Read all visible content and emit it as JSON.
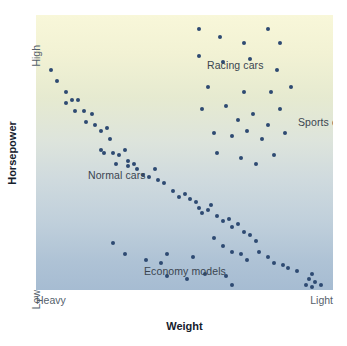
{
  "chart_data": {
    "type": "scatter",
    "title": "",
    "xlabel": "Weight",
    "ylabel": "Horsepower",
    "xlim": [
      "Heavy",
      "Light"
    ],
    "ylim": [
      "Low",
      "High"
    ],
    "x_tick_labels": [
      "Heavy",
      "Light"
    ],
    "y_tick_labels": [
      "High",
      "Low"
    ],
    "grid": false,
    "legend": "none",
    "axis_note": "Qualitative axes: x runs Heavy (left) to Light (right); y runs Low (bottom) to High (top). Values below are normalized 0-100 where x=0 is Heavy, x=100 is Light, y=0 is Low, y=100 is High.",
    "marker_color": "#2e4a72",
    "background_gradient": [
      "#f8f7d9",
      "#dde4dc",
      "#a6bcd2"
    ],
    "annotations": [
      {
        "text": "Racing cars",
        "x": 46,
        "y": 89
      },
      {
        "text": "Sports cars",
        "x": 77,
        "y": 68
      },
      {
        "text": "Normal cars",
        "x": 7,
        "y": 49
      },
      {
        "text": "Economy models",
        "x": 25,
        "y": 14
      }
    ],
    "series": [
      {
        "name": "all cars",
        "points": [
          [
            5,
            80
          ],
          [
            7,
            76
          ],
          [
            10,
            72
          ],
          [
            10,
            68
          ],
          [
            12,
            69
          ],
          [
            14,
            69
          ],
          [
            13,
            65
          ],
          [
            16,
            65
          ],
          [
            19,
            64
          ],
          [
            17,
            61
          ],
          [
            20,
            60
          ],
          [
            22,
            58
          ],
          [
            24,
            59
          ],
          [
            25,
            55
          ],
          [
            22,
            51
          ],
          [
            23,
            50
          ],
          [
            26,
            50
          ],
          [
            28,
            49
          ],
          [
            30,
            51
          ],
          [
            31,
            47
          ],
          [
            33,
            46
          ],
          [
            27,
            46
          ],
          [
            31,
            45
          ],
          [
            34,
            44
          ],
          [
            36,
            42
          ],
          [
            38,
            41
          ],
          [
            40,
            44
          ],
          [
            41,
            40
          ],
          [
            43,
            39
          ],
          [
            46,
            36
          ],
          [
            48,
            34
          ],
          [
            50,
            35
          ],
          [
            52,
            33
          ],
          [
            54,
            32
          ],
          [
            55,
            30
          ],
          [
            56,
            28
          ],
          [
            58,
            29
          ],
          [
            59,
            31
          ],
          [
            61,
            27
          ],
          [
            63,
            25
          ],
          [
            65,
            26
          ],
          [
            66,
            23
          ],
          [
            68,
            24
          ],
          [
            70,
            21
          ],
          [
            72,
            20
          ],
          [
            74,
            18
          ],
          [
            60,
            19
          ],
          [
            63,
            16
          ],
          [
            66,
            14
          ],
          [
            69,
            13
          ],
          [
            71,
            11
          ],
          [
            75,
            14
          ],
          [
            78,
            12
          ],
          [
            80,
            10
          ],
          [
            83,
            9
          ],
          [
            85,
            8
          ],
          [
            88,
            7
          ],
          [
            93,
            6
          ],
          [
            92,
            4
          ],
          [
            94,
            3
          ],
          [
            96,
            2
          ],
          [
            91,
            2
          ],
          [
            93,
            1
          ],
          [
            26,
            17
          ],
          [
            30,
            13
          ],
          [
            37,
            11
          ],
          [
            42,
            10
          ],
          [
            44,
            13
          ],
          [
            53,
            12
          ],
          [
            44,
            5
          ],
          [
            51,
            4
          ],
          [
            57,
            6
          ],
          [
            64,
            5
          ],
          [
            66,
            2
          ],
          [
            55,
            95
          ],
          [
            62,
            92
          ],
          [
            70,
            90
          ],
          [
            78,
            95
          ],
          [
            82,
            90
          ],
          [
            55,
            85
          ],
          [
            63,
            83
          ],
          [
            72,
            84
          ],
          [
            81,
            80
          ],
          [
            58,
            74
          ],
          [
            70,
            72
          ],
          [
            79,
            72
          ],
          [
            86,
            74
          ],
          [
            56,
            66
          ],
          [
            64,
            67
          ],
          [
            68,
            62
          ],
          [
            73,
            64
          ],
          [
            78,
            60
          ],
          [
            82,
            66
          ],
          [
            60,
            57
          ],
          [
            66,
            56
          ],
          [
            71,
            58
          ],
          [
            76,
            55
          ],
          [
            84,
            57
          ],
          [
            61,
            50
          ],
          [
            69,
            48
          ],
          [
            74,
            46
          ],
          [
            80,
            49
          ]
        ]
      }
    ]
  },
  "plot": {
    "annotations": {
      "racing": "Racing cars",
      "sports": "Sports cars",
      "normal": "Normal cars",
      "economy": "Economy models"
    }
  },
  "axes": {
    "y": {
      "title": "Horsepower",
      "high_label": "High",
      "low_label": "Low"
    },
    "x": {
      "title": "Weight",
      "heavy_label": "Heavy",
      "light_label": "Light"
    }
  }
}
